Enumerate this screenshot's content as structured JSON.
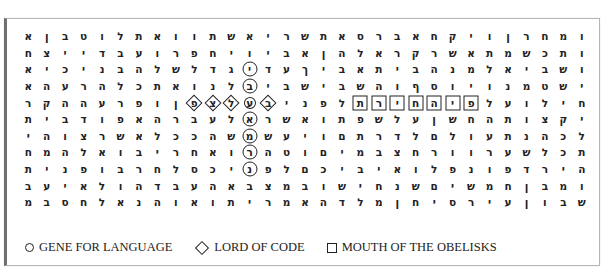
{
  "legend": {
    "items": [
      {
        "shape": "circle",
        "label": "GENE FOR LANGUAGE"
      },
      {
        "shape": "diamond",
        "label": "LORD OF CODE"
      },
      {
        "shape": "square",
        "label": "MOUTH OF THE OBELISKS"
      }
    ]
  },
  "grid": {
    "columns": 31,
    "rows": [
      "ומחרןויקחאברסאתשריאשתוואתלוטבןאח",
      "ותכשמתאשרקראלהןאביויחפרועבדייצח",
      "ושביאלמנהביתאביךעדיגדלשלהבניכיאמ",
      "ישטמנויוסףוהשביבלנואתכלהרעהאשר",
      "חילועלפיהחירתלפניבעלצפוופרעההקרי",
      "יקצותהחשןעלשפתואשראלעברהאפודביתח",
      "לכהנתעולםלדרתםויעשמהככלאשרצוהיח",
      "תכלשערוורחצבמיםוטהרואחריבואלהמח",
      "הירדפונפלואיביכםלפניכסלחרבופניח",
      "ומבןחמשיםשנחישובמצבאהעבדהולאיעבד",
      "שבוןעיריסחןמלדהאמריתואוהנאלחסבמ"
    ]
  },
  "rows_display": [
    [
      "ו",
      "מ",
      "ח",
      "ר",
      "ן",
      "ו",
      "י",
      "ק",
      "ח",
      "א",
      "ב",
      "ר",
      "ס",
      "א",
      "ת",
      "ש",
      "ר",
      "י",
      "א",
      "ש",
      "ת",
      "ו",
      "ו",
      "א",
      "ת",
      "ל",
      "ו",
      "ט",
      "ב",
      "ן",
      "א",
      "ח"
    ],
    [
      "ו",
      "ת",
      "כ",
      "ש",
      "מ",
      "ת",
      "א",
      "ש",
      "ר",
      "ק",
      "ר",
      "א",
      "ל",
      "ה",
      "ן",
      "א",
      "ב",
      "י",
      "ו",
      "י",
      "ח",
      "פ",
      "ר",
      "ו",
      "ע",
      "ב",
      "ד",
      "י",
      "י",
      "צ",
      "ח"
    ],
    [
      "ו",
      "ש",
      "ב",
      "י",
      "א",
      "ל",
      "מ",
      "נ",
      "ה",
      "ב",
      "י",
      "ת",
      "א",
      "ב",
      "י",
      "ך",
      "ע",
      "ד",
      "י",
      "ג",
      "ד",
      "ל",
      "ש",
      "ל",
      "ה",
      "ב",
      "נ",
      "י",
      "כ",
      "י",
      "א",
      "מ"
    ],
    [
      "י",
      "ש",
      "ט",
      "מ",
      "נ",
      "ו",
      "י",
      "ו",
      "ס",
      "ף",
      "ו",
      "ה",
      "ש",
      "ב",
      "י",
      "ש",
      "ב",
      "י",
      "ב",
      "ל",
      "נ",
      "ו",
      "א",
      "ת",
      "כ",
      "ל",
      "ה",
      "ר",
      "ע",
      "ה",
      "א",
      "ש",
      "ר"
    ],
    [
      "ח",
      "י",
      "ל",
      "ו",
      "ע",
      "ל",
      "פ",
      "י",
      "ה",
      "ח",
      "י",
      "ר",
      "ת",
      "ל",
      "פ",
      "נ",
      "י",
      "ב",
      "ע",
      "ל",
      "צ",
      "פ",
      "ן",
      "ו",
      "פ",
      "ר",
      "ע",
      "ה",
      "ה",
      "ק",
      "ר",
      "י"
    ],
    [
      "י",
      "ק",
      "צ",
      "ו",
      "ת",
      "ה",
      "ח",
      "ש",
      "ן",
      "ע",
      "ל",
      "ש",
      "פ",
      "ת",
      "ו",
      "א",
      "ש",
      "ר",
      "א",
      "ל",
      "ע",
      "ב",
      "ר",
      "ה",
      "א",
      "פ",
      "ו",
      "ד",
      "ב",
      "י",
      "ת",
      "ח"
    ],
    [
      "ל",
      "כ",
      "ה",
      "נ",
      "ת",
      "ע",
      "ו",
      "ל",
      "ם",
      "ל",
      "ד",
      "ר",
      "ת",
      "ם",
      "ו",
      "י",
      "ע",
      "ש",
      "מ",
      "ש",
      "ה",
      "כ",
      "כ",
      "ל",
      "א",
      "ש",
      "ר",
      "צ",
      "ו",
      "ה",
      "י",
      "ח"
    ],
    [
      "ת",
      "כ",
      "ל",
      "ש",
      "ע",
      "ר",
      "ו",
      "ו",
      "ר",
      "ח",
      "צ",
      "ב",
      "מ",
      "י",
      "ם",
      "ו",
      "ט",
      "ה",
      "ר",
      "ו",
      "א",
      "ח",
      "ר",
      "י",
      "ב",
      "ו",
      "א",
      "ל",
      "ה",
      "מ",
      "ח"
    ],
    [
      "ה",
      "י",
      "ר",
      "ד",
      "פ",
      "ו",
      "נ",
      "פ",
      "ל",
      "ו",
      "א",
      "י",
      "ב",
      "י",
      "כ",
      "ם",
      "ל",
      "פ",
      "נ",
      "י",
      "כ",
      "ס",
      "ל",
      "ח",
      "ר",
      "ב",
      "ו",
      "פ",
      "נ",
      "י",
      "ת"
    ],
    [
      "ו",
      "מ",
      "ב",
      "ן",
      "ח",
      "מ",
      "ש",
      "י",
      "ם",
      "ש",
      "נ",
      "ח",
      "י",
      "ש",
      "ו",
      "ב",
      "מ",
      "צ",
      "ב",
      "א",
      "ה",
      "ע",
      "ב",
      "ד",
      "ה",
      "ו",
      "ל",
      "א",
      "י",
      "ע",
      "ב",
      "ד"
    ],
    [
      "ש",
      "ב",
      "ו",
      "ן",
      "ע",
      "י",
      "ר",
      "ס",
      "י",
      "ח",
      "ן",
      "מ",
      "ל",
      "ד",
      "ה",
      "א",
      "מ",
      "ר",
      "י",
      "ת",
      "ו",
      "א",
      "ו",
      "ה",
      "נ",
      "א",
      "ל",
      "ח",
      "ס",
      "ב",
      "מ"
    ]
  ]
}
